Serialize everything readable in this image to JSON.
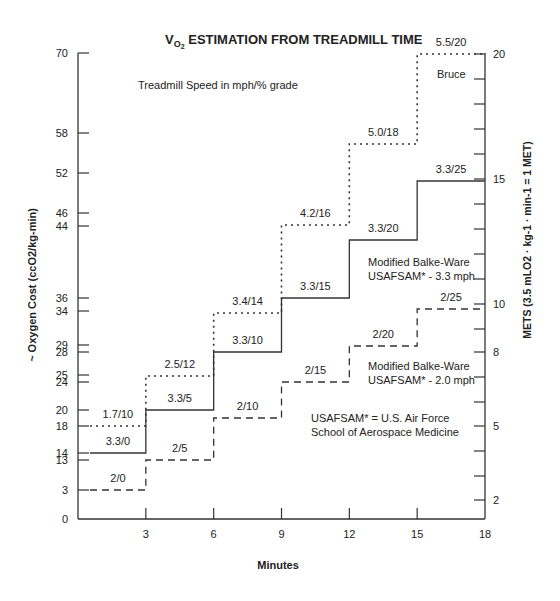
{
  "chart_data": {
    "type": "line",
    "subtype": "step",
    "title": "VO2 ESTIMATION FROM TREADMILL TIME",
    "title_parts": {
      "v": "V",
      "sub": "O",
      "subsub": "2",
      "rest": " ESTIMATION FROM TREADMILL TIME"
    },
    "xlabel": "Minutes",
    "ylabel": "~ Oxygen Cost (ccO2/kg-min)",
    "ylabel_right": "METS (3.5 mLO2 · kg-1 · min-1 = 1 MET)",
    "xlim": [
      0,
      18
    ],
    "ylim": [
      0,
      70
    ],
    "x_ticks": [
      3,
      6,
      9,
      12,
      15,
      18
    ],
    "y_ticks_left": [
      {
        "v": 70,
        "y": 53
      },
      {
        "v": 58,
        "y": 133
      },
      {
        "v": 52,
        "y": 173
      },
      {
        "v": 46,
        "y": 213
      },
      {
        "v": 44,
        "y": 226
      },
      {
        "v": 36,
        "y": 298
      },
      {
        "v": 34,
        "y": 311
      },
      {
        "v": 29,
        "y": 345
      },
      {
        "v": 28,
        "y": 352
      },
      {
        "v": 25,
        "y": 375
      },
      {
        "v": 24,
        "y": 382
      },
      {
        "v": 20,
        "y": 410
      },
      {
        "v": 18,
        "y": 426
      },
      {
        "v": 14,
        "y": 453
      },
      {
        "v": 13,
        "y": 460
      },
      {
        "v": 3,
        "y": 490
      },
      {
        "v": 0,
        "y": 519
      }
    ],
    "y_ticks_right": [
      {
        "v": "20",
        "y": 54
      },
      {
        "v": "",
        "y": 79
      },
      {
        "v": "",
        "y": 104
      },
      {
        "v": "",
        "y": 129
      },
      {
        "v": "",
        "y": 154
      },
      {
        "v": "15",
        "y": 179
      },
      {
        "v": "",
        "y": 204
      },
      {
        "v": "",
        "y": 229
      },
      {
        "v": "",
        "y": 254
      },
      {
        "v": "",
        "y": 279
      },
      {
        "v": "10",
        "y": 304
      },
      {
        "v": "",
        "y": 329
      },
      {
        "v": "8",
        "y": 352
      },
      {
        "v": "",
        "y": 377
      },
      {
        "v": "",
        "y": 402
      },
      {
        "v": "5",
        "y": 426
      },
      {
        "v": "",
        "y": 451
      },
      {
        "v": "",
        "y": 476
      },
      {
        "v": "2",
        "y": 500
      }
    ],
    "annotation_top": "Treadmill Speed in mph/% grade",
    "footnote": [
      "USAFSAM* = U.S. Air Force",
      "School of Aerospace Medicine"
    ],
    "series": [
      {
        "name": "Bruce",
        "style": "dotted",
        "legend_label": [
          "Bruce"
        ],
        "steps": [
          {
            "x0": 0,
            "x1": 3,
            "v": 18,
            "y": 426,
            "label": "1.7/10"
          },
          {
            "x0": 3,
            "x1": 6,
            "v": 25,
            "y": 376,
            "label": "2.5/12"
          },
          {
            "x0": 6,
            "x1": 9,
            "v": 34,
            "y": 313,
            "label": "3.4/14"
          },
          {
            "x0": 9,
            "x1": 12,
            "v": 46,
            "y": 225,
            "label": "4.2/16"
          },
          {
            "x0": 12,
            "x1": 15,
            "v": 58,
            "y": 144,
            "label": "5.0/18"
          },
          {
            "x0": 15,
            "x1": 18,
            "v": 70,
            "y": 54,
            "label": "5.5/20"
          }
        ]
      },
      {
        "name": "Modified Balke-Ware USAFSAM* - 3.3 mph",
        "style": "solid",
        "legend_label": [
          "Modified Balke-Ware",
          "USAFSAM* - 3.3 mph"
        ],
        "steps": [
          {
            "x0": 0,
            "x1": 3,
            "v": 14,
            "y": 453,
            "label": "3.3/0"
          },
          {
            "x0": 3,
            "x1": 6,
            "v": 20,
            "y": 410,
            "label": "3.3/5"
          },
          {
            "x0": 6,
            "x1": 9,
            "v": 28,
            "y": 352,
            "label": "3.3/10"
          },
          {
            "x0": 9,
            "x1": 12,
            "v": 36,
            "y": 298,
            "label": "3.3/15"
          },
          {
            "x0": 12,
            "x1": 15,
            "v": 44,
            "y": 240,
            "label": "3.3/20"
          },
          {
            "x0": 15,
            "x1": 18,
            "v": 52,
            "y": 181,
            "label": "3.3/25"
          }
        ]
      },
      {
        "name": "Modified Balke-Ware USAFSAM* - 2.0 mph",
        "style": "dashed",
        "legend_label": [
          "Modified Balke-Ware",
          "USAFSAM* - 2.0 mph"
        ],
        "steps": [
          {
            "x0": 0,
            "x1": 3,
            "v": 3,
            "y": 490,
            "label": "2/0"
          },
          {
            "x0": 3,
            "x1": 6,
            "v": 13,
            "y": 460,
            "label": "2/5"
          },
          {
            "x0": 6,
            "x1": 9,
            "v": 20,
            "y": 418,
            "label": "2/10"
          },
          {
            "x0": 9,
            "x1": 12,
            "v": 24,
            "y": 382,
            "label": "2/15"
          },
          {
            "x0": 12,
            "x1": 15,
            "v": 29,
            "y": 346,
            "label": "2/20"
          },
          {
            "x0": 15,
            "x1": 18,
            "v": 34,
            "y": 309,
            "label": "2/25"
          }
        ]
      }
    ],
    "grid": false,
    "legend_position": "inline"
  }
}
